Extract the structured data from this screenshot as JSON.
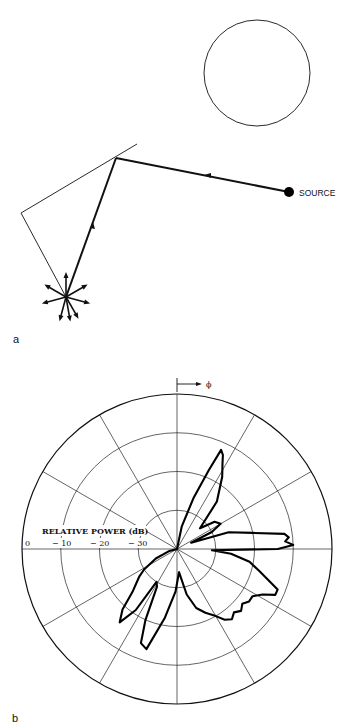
{
  "panel_a": {
    "label": "a",
    "source_label": "SOURCE",
    "elements": [
      "obstacle-circle",
      "reflecting-wall",
      "incident-ray",
      "reflected-ray",
      "scattered-receiver-point"
    ]
  },
  "panel_b": {
    "label": "b",
    "axis_title": "RELATIVE POWER (dB)",
    "angle_label": "ϕ",
    "ring_labels": [
      "0",
      "− 10",
      "− 20",
      "− 30"
    ]
  },
  "chart_data": {
    "type": "polar",
    "title": "",
    "radial_axis_label": "RELATIVE POWER (dB)",
    "angular_axis_label": "ϕ",
    "radial_ticks": [
      0,
      -10,
      -20,
      -30,
      -40
    ],
    "radial_range": [
      -40,
      0
    ],
    "angular_grid_step_deg": 30,
    "angle_convention": "clockwise from top",
    "grid": true,
    "series": [
      {
        "name": "scattered power pattern",
        "points_deg_db": [
          [
            0,
            -40
          ],
          [
            12,
            -34
          ],
          [
            18,
            -26
          ],
          [
            22,
            -18
          ],
          [
            24,
            -12
          ],
          [
            26,
            -13
          ],
          [
            28,
            -15
          ],
          [
            32,
            -18
          ],
          [
            40,
            -24
          ],
          [
            48,
            -32
          ],
          [
            54,
            -28
          ],
          [
            60,
            -27
          ],
          [
            64,
            -30
          ],
          [
            66,
            -36
          ],
          [
            72,
            -26
          ],
          [
            78,
            -20
          ],
          [
            82,
            -12
          ],
          [
            84,
            -11
          ],
          [
            86,
            -12
          ],
          [
            88,
            -10
          ],
          [
            90,
            -14
          ],
          [
            92,
            -31
          ],
          [
            95,
            -26
          ],
          [
            100,
            -21
          ],
          [
            105,
            -18
          ],
          [
            110,
            -14
          ],
          [
            112,
            -12
          ],
          [
            115,
            -12
          ],
          [
            118,
            -15
          ],
          [
            122,
            -17
          ],
          [
            126,
            -17
          ],
          [
            130,
            -18
          ],
          [
            134,
            -17
          ],
          [
            138,
            -18
          ],
          [
            142,
            -17
          ],
          [
            146,
            -18
          ],
          [
            150,
            -20
          ],
          [
            156,
            -22
          ],
          [
            162,
            -24
          ],
          [
            168,
            -28
          ],
          [
            175,
            -34
          ],
          [
            182,
            -29
          ],
          [
            190,
            -22
          ],
          [
            197,
            -13
          ],
          [
            201,
            -14
          ],
          [
            204,
            -20
          ],
          [
            208,
            -29
          ],
          [
            212,
            -30
          ],
          [
            214,
            -21
          ],
          [
            218,
            -16
          ],
          [
            222,
            -19
          ],
          [
            226,
            -24
          ],
          [
            234,
            -28
          ],
          [
            238,
            -30
          ],
          [
            246,
            -34
          ],
          [
            256,
            -38
          ],
          [
            270,
            -40
          ]
        ]
      }
    ]
  }
}
